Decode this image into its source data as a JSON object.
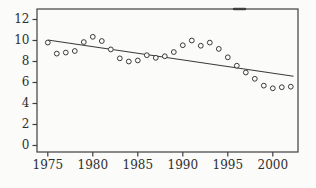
{
  "chart_data": {
    "type": "scatter",
    "x": [
      1975,
      1976,
      1977,
      1978,
      1979,
      1980,
      1981,
      1982,
      1983,
      1984,
      1985,
      1986,
      1987,
      1988,
      1989,
      1990,
      1991,
      1992,
      1993,
      1994,
      1995,
      1996,
      1997,
      1998,
      1999,
      2000,
      2001,
      2002
    ],
    "values": [
      9.8,
      8.75,
      8.85,
      9.0,
      9.85,
      10.35,
      9.95,
      9.15,
      8.3,
      8.0,
      8.1,
      8.6,
      8.35,
      8.5,
      8.9,
      9.55,
      10.0,
      9.5,
      9.8,
      9.2,
      8.4,
      7.6,
      6.95,
      6.35,
      5.7,
      5.45,
      5.55,
      5.6
    ],
    "trend_line": {
      "x1": 1975,
      "y1": 10.05,
      "x2": 2002.3,
      "y2": 6.6
    },
    "x_ticks": [
      1975,
      1980,
      1985,
      1990,
      1995,
      2000
    ],
    "y_ticks": [
      0,
      2,
      4,
      6,
      8,
      10,
      12
    ],
    "xlim": [
      1973.8,
      2002.8
    ],
    "ylim": [
      -0.62,
      13.0
    ],
    "grid": false,
    "marker": "open-circle",
    "colors": {
      "stroke": "#3a3a3a",
      "frame": "#3f3f3f",
      "label": "#2e2e2e",
      "background": "#fbfbfa",
      "marker_fill": "#fbfbfa"
    }
  }
}
